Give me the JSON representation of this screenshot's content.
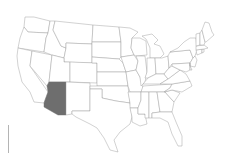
{
  "map": {
    "title": "United States",
    "highlighted_state": "Arizona",
    "colors": {
      "background": "#ffffff",
      "state_fill": "#ffffff",
      "state_stroke": "#9a9a9a",
      "highlight_fill": "#6e6e6e"
    },
    "states": [
      {
        "id": "WA",
        "name": "Washington",
        "highlight": false,
        "points": "25,17 34,17 50,21 48,33 28,32 24,27"
      },
      {
        "id": "OR",
        "name": "Oregon",
        "highlight": false,
        "points": "24,27 28,32 48,33 46,38 44,52 18,48 20,38"
      },
      {
        "id": "CA",
        "name": "California",
        "highlight": false,
        "points": "18,48 32,51 30,66 48,92 44,103 34,102 30,92 22,82 18,66 17,56"
      },
      {
        "id": "NV",
        "name": "Nevada",
        "highlight": false,
        "points": "32,51 52,55 49,82 47,86 30,66"
      },
      {
        "id": "ID",
        "name": "Idaho",
        "highlight": false,
        "points": "50,21 55,21 53,30 58,40 61,46 66,48 64,58 52,55 44,52 46,38 48,33"
      },
      {
        "id": "MT",
        "name": "Montana",
        "highlight": false,
        "points": "55,21 93,25 92,44 66,43 66,48 61,46 58,40 53,30"
      },
      {
        "id": "WY",
        "name": "Wyoming",
        "highlight": false,
        "points": "66,43 92,44 92,63 64,62 64,58 66,48"
      },
      {
        "id": "UT",
        "name": "Utah",
        "highlight": false,
        "points": "52,55 64,58 64,62 70,62 70,82 49,82"
      },
      {
        "id": "AZ",
        "name": "Arizona",
        "highlight": true,
        "points": "49,82 66,82 66,115 58,115 44,107 44,103 48,92 47,86"
      },
      {
        "id": "CO",
        "name": "Colorado",
        "highlight": false,
        "points": "70,62 97,63 97,83 70,82"
      },
      {
        "id": "NM",
        "name": "New Mexico",
        "highlight": false,
        "points": "66,82 90,83 90,111 72,111 72,114 66,115"
      },
      {
        "id": "ND",
        "name": "North Dakota",
        "highlight": false,
        "points": "93,25 119,27 121,42 92,42"
      },
      {
        "id": "SD",
        "name": "South Dakota",
        "highlight": false,
        "points": "92,42 121,42 121,57 119,59 92,57"
      },
      {
        "id": "NE",
        "name": "Nebraska",
        "highlight": false,
        "points": "92,57 119,59 123,63 126,72 97,72 97,63 92,63"
      },
      {
        "id": "KS",
        "name": "Kansas",
        "highlight": false,
        "points": "97,72 126,72 128,86 97,86"
      },
      {
        "id": "OK",
        "name": "Oklahoma",
        "highlight": false,
        "points": "90,86 128,86 130,103 116,101 102,98 102,89 90,89"
      },
      {
        "id": "TX",
        "name": "Texas",
        "highlight": false,
        "points": "90,89 102,89 102,98 116,101 130,103 132,117 130,124 120,132 114,140 118,152 110,150 104,138 97,128 90,124 82,120 76,117 72,114 72,111 90,111"
      },
      {
        "id": "MN",
        "name": "Minnesota",
        "highlight": false,
        "points": "119,27 130,28 138,32 132,38 131,48 134,55 121,57 121,42"
      },
      {
        "id": "IA",
        "name": "Iowa",
        "highlight": false,
        "points": "121,57 134,55 138,61 136,70 126,72 123,63"
      },
      {
        "id": "MO",
        "name": "Missouri",
        "highlight": false,
        "points": "126,72 136,70 140,77 143,88 141,92 130,92 128,86"
      },
      {
        "id": "AR",
        "name": "Arkansas",
        "highlight": false,
        "points": "128,92 141,92 141,100 138,108 130,108 130,103"
      },
      {
        "id": "LA",
        "name": "Louisiana",
        "highlight": false,
        "points": "130,108 138,108 138,114 145,114 147,124 140,126 132,122 132,117"
      },
      {
        "id": "WI",
        "name": "Wisconsin",
        "highlight": false,
        "points": "132,38 140,38 146,41 147,55 136,56 134,55 131,48"
      },
      {
        "id": "IL",
        "name": "Illinois",
        "highlight": false,
        "points": "136,56 145,56 147,72 145,82 141,86 140,77 136,70 138,61"
      },
      {
        "id": "MI",
        "name": "Michigan",
        "highlight": false,
        "points": "142,36 152,34 158,40 154,44 160,46 164,54 160,58 150,58 150,48 147,41 146,39"
      },
      {
        "id": "IN",
        "name": "Indiana",
        "highlight": false,
        "points": "147,58 155,58 156,74 148,78 145,78 147,72"
      },
      {
        "id": "OH",
        "name": "Ohio",
        "highlight": false,
        "points": "155,58 162,58 168,56 169,68 164,74 156,74"
      },
      {
        "id": "KY",
        "name": "Kentucky",
        "highlight": false,
        "points": "143,84 148,78 156,74 164,74 168,79 160,84"
      },
      {
        "id": "TN",
        "name": "Tennessee",
        "highlight": false,
        "points": "141,92 143,86 172,84 170,88 164,92"
      },
      {
        "id": "MS",
        "name": "Mississippi",
        "highlight": false,
        "points": "141,92 149,92 149,118 145,118 145,114 138,114 138,108 141,100"
      },
      {
        "id": "AL",
        "name": "Alabama",
        "highlight": false,
        "points": "149,92 157,92 160,112 152,113 152,118 149,118"
      },
      {
        "id": "GA",
        "name": "Georgia",
        "highlight": false,
        "points": "157,92 165,92 174,102 172,112 160,112"
      },
      {
        "id": "FL",
        "name": "Florida",
        "highlight": false,
        "points": "152,113 160,112 172,112 176,122 182,136 182,146 178,146 172,134 168,122 160,118 152,118"
      },
      {
        "id": "SC",
        "name": "South Carolina",
        "highlight": false,
        "points": "165,92 172,90 180,93 174,102"
      },
      {
        "id": "NC",
        "name": "North Carolina",
        "highlight": false,
        "points": "164,92 170,88 172,84 190,81 192,86 182,92 172,90"
      },
      {
        "id": "VA",
        "name": "Virginia",
        "highlight": false,
        "points": "160,84 168,79 172,76 180,70 186,74 190,81 172,84"
      },
      {
        "id": "WV",
        "name": "West Virginia",
        "highlight": false,
        "points": "164,74 169,68 172,66 176,68 180,70 172,76 168,79"
      },
      {
        "id": "PA",
        "name": "Pennsylvania",
        "highlight": false,
        "points": "168,56 170,52 190,50 193,58 190,63 172,64 169,68"
      },
      {
        "id": "NY",
        "name": "New York",
        "highlight": false,
        "points": "170,52 178,48 184,42 190,38 196,38 197,50 195,56 193,58 190,50"
      },
      {
        "id": "MD",
        "name": "Maryland",
        "highlight": false,
        "points": "172,64 190,63 190,70 186,72 180,70 176,68 172,66"
      },
      {
        "id": "NJ",
        "name": "New Jersey",
        "highlight": false,
        "points": "193,58 195,56 197,60 195,67 190,66 190,63"
      },
      {
        "id": "DE",
        "name": "Delaware",
        "highlight": false,
        "points": "190,63 190,66 192,70 190,70"
      },
      {
        "id": "CT",
        "name": "Connecticut",
        "highlight": false,
        "points": "196,50 202,49 202,53 197,55"
      },
      {
        "id": "RI",
        "name": "Rhode Island",
        "highlight": false,
        "points": "202,49 204,49 204,52 202,53"
      },
      {
        "id": "MA",
        "name": "Massachusetts",
        "highlight": false,
        "points": "196,46 204,45 208,48 204,49 196,50"
      },
      {
        "id": "VT",
        "name": "Vermont",
        "highlight": false,
        "points": "196,34 200,33 200,45 196,46"
      },
      {
        "id": "NH",
        "name": "New Hampshire",
        "highlight": false,
        "points": "200,33 202,30 205,42 204,45 200,45"
      },
      {
        "id": "ME",
        "name": "Maine",
        "highlight": false,
        "points": "202,30 205,22 209,23 212,32 214,35 206,42 205,42"
      }
    ]
  },
  "scale_bar": {
    "orientation": "vertical",
    "color": "#b4b4b4"
  }
}
